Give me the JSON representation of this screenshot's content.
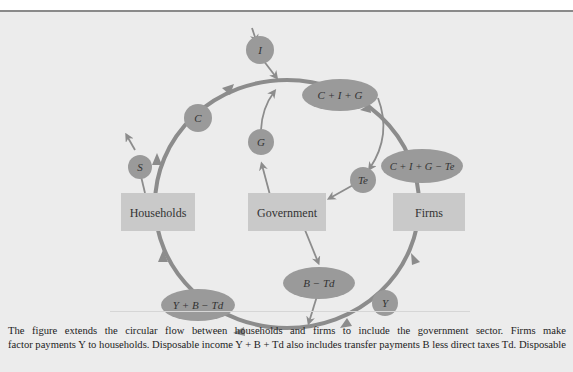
{
  "diagram": {
    "nodes": {
      "households": "Households",
      "government": "Government",
      "firms": "Firms"
    },
    "flows": {
      "investment": "I",
      "consumption": "C",
      "saving": "S",
      "government_spending": "G",
      "total_expenditure": "C + I + G",
      "indirect_taxes": "Te",
      "net_expenditure": "C + I + G − Te",
      "factor_payments": "Y",
      "transfers_less_taxes": "B − Td",
      "disposable_income": "Y + B − Td"
    },
    "colors": {
      "background": "#ececec",
      "box_fill": "#c9c9c9",
      "bubble_fill": "#9a9a9a",
      "flow_line": "#8c8c8c",
      "text": "#333333"
    }
  },
  "caption": {
    "line1": "The figure extends the circular flow between households and firms to include the government sector. Firms make",
    "line2": "factor payments Y to households. Disposable income Y + B + Td also includes transfer payments B less direct taxes Td. Disposable"
  }
}
